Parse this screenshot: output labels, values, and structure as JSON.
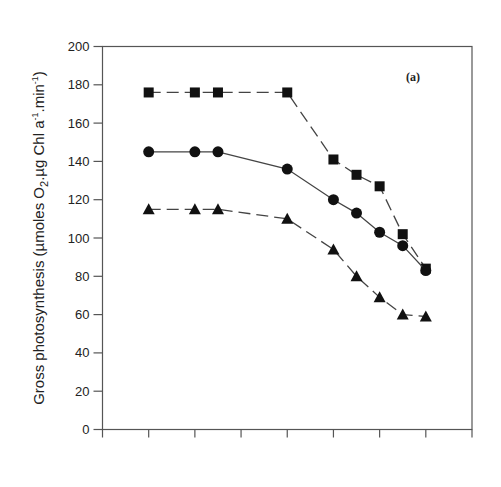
{
  "chart_data": {
    "type": "line",
    "title": "",
    "panel_label": "(a)",
    "xlabel": "",
    "ylabel": "Gross photosynthesis (µmoles O₂.µg Chl a⁻¹.min⁻¹)",
    "ylabel_parts": {
      "main": "Gross photosynthesis (µmoles O",
      "sub2": "2",
      "mid": ".µg Chl a",
      "sup1": "-1",
      "mid2": ".min",
      "sup2": "-1",
      "end": ")"
    },
    "ylim": [
      0,
      200
    ],
    "yticks": [
      0,
      20,
      40,
      60,
      80,
      100,
      120,
      140,
      160,
      180,
      200
    ],
    "xlim": [
      0,
      8
    ],
    "xticks": [
      0,
      1,
      2,
      3,
      4,
      5,
      6,
      7,
      8
    ],
    "xtick_labels": [],
    "grid": false,
    "legend": null,
    "x": [
      1,
      2,
      2.5,
      4,
      5,
      5.5,
      6,
      6.5,
      7
    ],
    "series": [
      {
        "name": "squares",
        "marker": "square",
        "line": "dashed",
        "values": [
          176,
          176,
          176,
          176,
          141,
          133,
          127,
          102,
          84
        ]
      },
      {
        "name": "circles",
        "marker": "circle",
        "line": "solid",
        "values": [
          145,
          145,
          145,
          136,
          120,
          113,
          103,
          96,
          83
        ]
      },
      {
        "name": "triangles",
        "marker": "triangle",
        "line": "dashed",
        "values": [
          115,
          115,
          115,
          110,
          94,
          80,
          69,
          60,
          59
        ]
      }
    ]
  },
  "colors": {
    "axis": "#555555",
    "series": "#111111",
    "line": "#444444"
  }
}
